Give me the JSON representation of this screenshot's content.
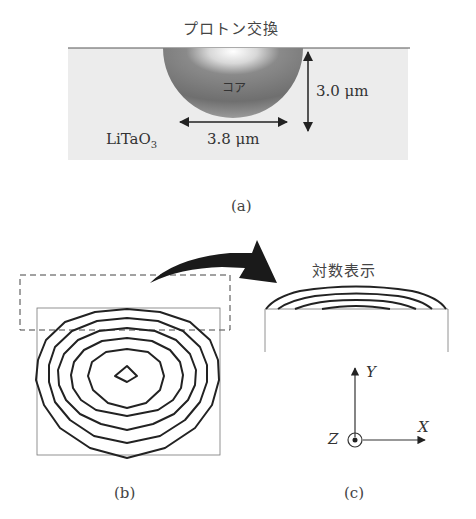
{
  "panel_a": {
    "title": "プロトン交換",
    "core_label": "コア",
    "substrate_label": "LiTaO",
    "substrate_subscript": "3",
    "depth_label": "3.0 μm",
    "width_label": "3.8 μm",
    "caption": "(a)"
  },
  "panel_b": {
    "caption": "(b)",
    "contour_count": 6
  },
  "panel_c": {
    "title": "対数表示",
    "caption": "(c)",
    "axes": {
      "x": "X",
      "y": "Y",
      "z": "Z"
    }
  },
  "colors": {
    "substrate": "#ededed",
    "core": "#7a7a7a",
    "line": "#222222"
  }
}
